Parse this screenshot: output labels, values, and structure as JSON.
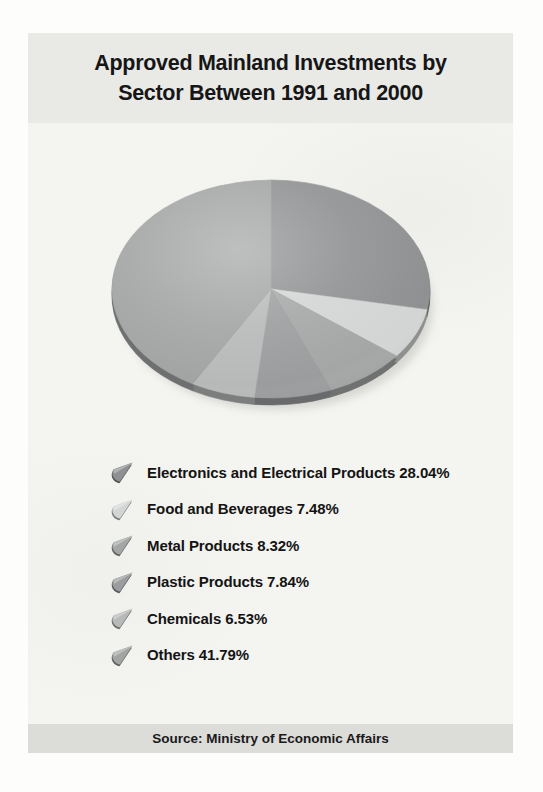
{
  "page": {
    "title_line1": "Approved Mainland Investments by",
    "title_line2": "Sector Between 1991 and 2000",
    "source": "Source: Ministry of Economic Affairs"
  },
  "colors": {
    "page_bg": "#fdfdfb",
    "title_band_bg": "#e9e9e6",
    "body_bg": "#f4f4f1",
    "source_band_bg": "#dcdcd9",
    "text": "#161616",
    "pie_rim_shade_factor": "0.68"
  },
  "chart_data": {
    "type": "pie",
    "style": "3d-ellipse",
    "title": "Approved Mainland Investments by Sector Between 1991 and 2000",
    "start_angle_deg": 0,
    "direction": "clockwise",
    "unit": "%",
    "slices": [
      {
        "label": "Electronics and Electrical Products",
        "value": 28.04,
        "color": "#8e9091"
      },
      {
        "label": "Food and Beverages",
        "value": 7.48,
        "color": "#d3d5d5"
      },
      {
        "label": "Metal Products",
        "value": 8.32,
        "color": "#a4a6a6"
      },
      {
        "label": "Plastic Products",
        "value": 7.84,
        "color": "#9a9c9d"
      },
      {
        "label": "Chemicals",
        "value": 6.53,
        "color": "#b7b9b9"
      },
      {
        "label": "Others",
        "value": 41.79,
        "color": "#a2a4a4"
      }
    ],
    "legend_position": "below",
    "source": "Source: Ministry of Economic Affairs"
  }
}
